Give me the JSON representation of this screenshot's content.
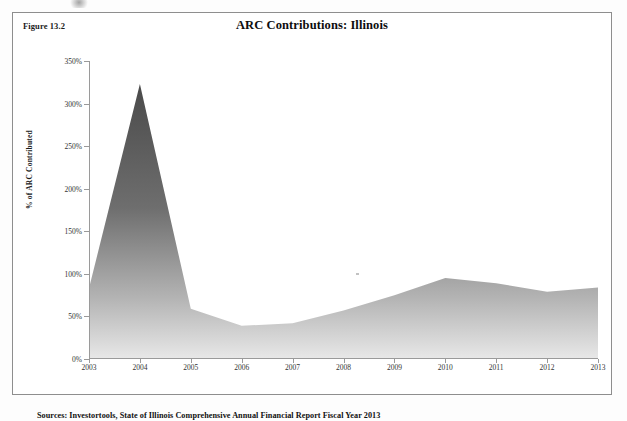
{
  "figure": {
    "label": "Figure 13.2",
    "title": "ARC Contributions: Illinois",
    "source_note": "Sources: Investortools, State of Illinois Comprehensive Annual Financial Report Fiscal Year 2013"
  },
  "chart_data": {
    "type": "area",
    "title": "ARC Contributions: Illinois",
    "xlabel": "",
    "ylabel": "% of ARC Contributed",
    "categories": [
      "2003",
      "2004",
      "2005",
      "2006",
      "2007",
      "2008",
      "2009",
      "2010",
      "2011",
      "2012",
      "2013"
    ],
    "values": [
      83,
      323,
      59,
      39,
      42,
      57,
      75,
      95,
      89,
      79,
      84
    ],
    "ylim": [
      0,
      350
    ],
    "ytick_labels": [
      "0%",
      "50%",
      "100%",
      "150%",
      "200%",
      "250%",
      "300%",
      "350%"
    ],
    "ytick_values": [
      0,
      50,
      100,
      150,
      200,
      250,
      300,
      350
    ],
    "grid": false,
    "legend": "none",
    "series_name": "% of ARC Contributed",
    "fill_top_color": "#4d4d4d",
    "fill_bottom_color": "#e4e4e4",
    "axis_color": "#9a9a9a"
  }
}
